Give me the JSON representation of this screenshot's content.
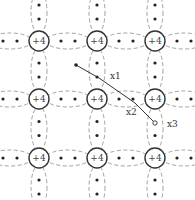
{
  "diagram": {
    "type": "silicon-lattice-covalent-bonds",
    "colors": {
      "bond_lobe": "#8a8a8a",
      "atom_stroke": "#333333",
      "electron": "#222222",
      "text": "#444444"
    },
    "atoms": {
      "label": "+4",
      "columns_x": [
        39,
        97,
        155
      ],
      "rows_y": [
        41,
        99,
        158
      ],
      "radius": 10
    },
    "atom_labels": [
      {
        "label": "+4"
      },
      {
        "label": "+4"
      },
      {
        "label": "+4"
      },
      {
        "label": "+4"
      },
      {
        "label": "+4"
      },
      {
        "label": "+4"
      },
      {
        "label": "+4"
      },
      {
        "label": "+4"
      },
      {
        "label": "+4"
      }
    ],
    "free_electron": {
      "x": 76,
      "y": 65
    },
    "hole": {
      "x": 155,
      "y": 123
    },
    "path": {
      "points": [
        [
          76,
          65
        ],
        [
          99,
          78
        ],
        [
          135,
          103
        ],
        [
          155,
          123
        ]
      ],
      "labels": [
        {
          "text": "x1",
          "x": 110,
          "y": 79
        },
        {
          "text": "x2",
          "x": 126,
          "y": 115
        },
        {
          "text": "x3",
          "x": 167,
          "y": 127
        }
      ]
    }
  }
}
